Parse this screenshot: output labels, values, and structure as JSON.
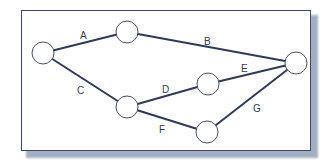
{
  "diagram": {
    "type": "network",
    "nodes": [
      {
        "id": "n1",
        "x": 43,
        "y": 53
      },
      {
        "id": "n2",
        "x": 127,
        "y": 32
      },
      {
        "id": "n3",
        "x": 127,
        "y": 107
      },
      {
        "id": "n4",
        "x": 208,
        "y": 84
      },
      {
        "id": "n5",
        "x": 207,
        "y": 132
      },
      {
        "id": "n6",
        "x": 296,
        "y": 63
      }
    ],
    "edges": [
      {
        "label": "A",
        "from": "n1",
        "to": "n2"
      },
      {
        "label": "B",
        "from": "n2",
        "to": "n6"
      },
      {
        "label": "C",
        "from": "n1",
        "to": "n3"
      },
      {
        "label": "D",
        "from": "n3",
        "to": "n4"
      },
      {
        "label": "E",
        "from": "n4",
        "to": "n6"
      },
      {
        "label": "F",
        "from": "n3",
        "to": "n5"
      },
      {
        "label": "G",
        "from": "n5",
        "to": "n6"
      }
    ]
  },
  "labels": {
    "A": "A",
    "B": "B",
    "C": "C",
    "D": "D",
    "E": "E",
    "F": "F",
    "G": "G"
  },
  "colors": {
    "edge": "#2f3a58",
    "frame_border": "#3f4a66",
    "shadow": "#5a6c93"
  }
}
